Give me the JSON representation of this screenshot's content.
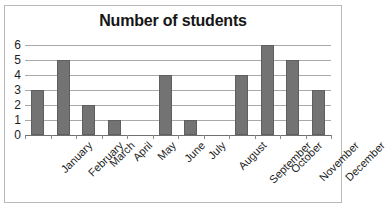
{
  "top_sliver_text": "",
  "chart_data": {
    "type": "bar",
    "title": "Number of students",
    "xlabel": "",
    "ylabel": "",
    "categories": [
      "January",
      "February",
      "March",
      "April",
      "May",
      "June",
      "July",
      "August",
      "September",
      "October",
      "November",
      "December"
    ],
    "values": [
      3,
      5,
      2,
      1,
      0,
      4,
      1,
      0,
      4,
      6,
      5,
      3
    ],
    "ylim": [
      0,
      6
    ],
    "yticks": [
      0,
      1,
      2,
      3,
      4,
      5,
      6
    ],
    "ytick_labels": [
      "0",
      "1",
      "2",
      "3",
      "4",
      "5",
      "6"
    ],
    "grid": true,
    "legend": false,
    "bar_color": "#737373",
    "bar_border_color": "#5f5f5f",
    "gridline_color": "#a9a9a9",
    "axis_color": "#6f6f6f",
    "frame_color": "#b9b9b9",
    "title_color": "#161616",
    "label_color": "#1c1c1c",
    "xlabel_rotation": -45
  }
}
